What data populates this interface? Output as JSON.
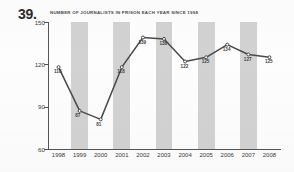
{
  "question": {
    "number": "39."
  },
  "chart_data": {
    "type": "line",
    "title": "NUMBER OF JOURNALISTS IN PRISON EACH YEAR SINCE 1998",
    "xlabel": "",
    "ylabel": "",
    "categories": [
      "1998",
      "1999",
      "2000",
      "2001",
      "2002",
      "2003",
      "2004",
      "2005",
      "2006",
      "2007",
      "2008"
    ],
    "values": [
      118,
      87,
      81,
      118,
      139,
      138,
      122,
      125,
      134,
      127,
      125
    ],
    "point_labels": [
      "118",
      "87",
      "81",
      "118",
      "139",
      "138",
      "122",
      "125",
      "134",
      "127",
      "125"
    ],
    "ylim": [
      60,
      150
    ],
    "yticks": [
      150,
      120,
      90,
      60
    ],
    "ytick_labels": [
      "150",
      "120",
      "90",
      "60"
    ],
    "grid": false,
    "legend": null,
    "shaded_bands": [
      "1999",
      "2001",
      "2003",
      "2005",
      "2007"
    ],
    "colors": {
      "line": "#4a4a4a",
      "marker": "#4a4a4a",
      "band": "#d2d2d2",
      "axis": "#555555",
      "text": "#3b3b3b",
      "background": "#fdfdfd"
    }
  }
}
